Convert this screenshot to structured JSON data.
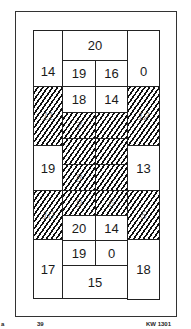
{
  "diagram": {
    "type": "grid-layout",
    "hatch_color": "#111111",
    "cells": [
      {
        "id": "top-left",
        "label": "14",
        "hatched": false
      },
      {
        "id": "top-center",
        "label": "20",
        "hatched": false
      },
      {
        "id": "top-right",
        "label": "0",
        "hatched": false
      },
      {
        "id": "r2-left",
        "label": "19",
        "hatched": false
      },
      {
        "id": "r2-right",
        "label": "16",
        "hatched": false
      },
      {
        "id": "r3-left",
        "label": "18",
        "hatched": false
      },
      {
        "id": "r3-right",
        "label": "14",
        "hatched": false
      },
      {
        "id": "side-left-upper",
        "label": "11",
        "hatched": true
      },
      {
        "id": "side-right-upper",
        "label": "12",
        "hatched": true
      },
      {
        "id": "center-1-left",
        "label": "7",
        "hatched": true
      },
      {
        "id": "center-1-right",
        "label": "",
        "hatched": true
      },
      {
        "id": "center-2-left",
        "label": "",
        "hatched": true
      },
      {
        "id": "center-2-right",
        "label": "",
        "hatched": true
      },
      {
        "id": "center-3-left",
        "label": "8",
        "hatched": true
      },
      {
        "id": "center-3-right",
        "label": "",
        "hatched": true
      },
      {
        "id": "center-4-left",
        "label": "9",
        "hatched": true
      },
      {
        "id": "center-4-right",
        "label": "6",
        "hatched": true
      },
      {
        "id": "mid-left",
        "label": "19",
        "hatched": false
      },
      {
        "id": "mid-right",
        "label": "13",
        "hatched": false
      },
      {
        "id": "side-left-lower",
        "label": "10",
        "hatched": true
      },
      {
        "id": "side-right-lower",
        "label": "5",
        "hatched": true
      },
      {
        "id": "r9-left",
        "label": "20",
        "hatched": false
      },
      {
        "id": "r9-right",
        "label": "14",
        "hatched": false
      },
      {
        "id": "r10-left",
        "label": "19",
        "hatched": false
      },
      {
        "id": "r10-right",
        "label": "0",
        "hatched": false
      },
      {
        "id": "bottom-left",
        "label": "17",
        "hatched": false
      },
      {
        "id": "bottom-center",
        "label": "15",
        "hatched": false
      },
      {
        "id": "bottom-right",
        "label": "18",
        "hatched": false
      }
    ]
  },
  "footer": {
    "left_mark": "a",
    "page_number": "39",
    "code": "KW 1301"
  }
}
